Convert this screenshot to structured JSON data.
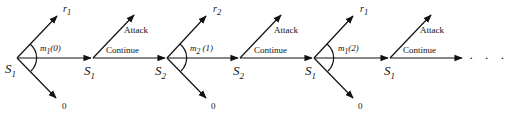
{
  "diagram": {
    "type": "game-tree",
    "nodes": [
      {
        "id": "n0",
        "label": "S",
        "sub": "1",
        "x": 17,
        "kind": "decision"
      },
      {
        "id": "n1",
        "label": "S",
        "sub": "1",
        "x": 93,
        "kind": "chance"
      },
      {
        "id": "n2",
        "label": "S",
        "sub": "2",
        "x": 167,
        "kind": "decision"
      },
      {
        "id": "n3",
        "label": "S",
        "sub": "2",
        "x": 240,
        "kind": "chance"
      },
      {
        "id": "n4",
        "label": "S",
        "sub": "1",
        "x": 314,
        "kind": "decision"
      },
      {
        "id": "n5",
        "label": "S",
        "sub": "1",
        "x": 390,
        "kind": "chance"
      }
    ],
    "messages": [
      {
        "label": "m",
        "sub": "1",
        "arg": "(0)"
      },
      {
        "label": "m",
        "sub": "2",
        "arg": "(1)"
      },
      {
        "label": "m",
        "sub": "1",
        "arg": "(2)"
      }
    ],
    "rewards": [
      {
        "label": "r",
        "sub": "1"
      },
      {
        "label": "r",
        "sub": "2"
      },
      {
        "label": "r",
        "sub": "1"
      }
    ],
    "zero_label": "0",
    "attack_label": "Attack",
    "continue_label": "Continue",
    "ellipsis": "· · ·",
    "line_color": "#111111",
    "background": "#ffffff"
  }
}
